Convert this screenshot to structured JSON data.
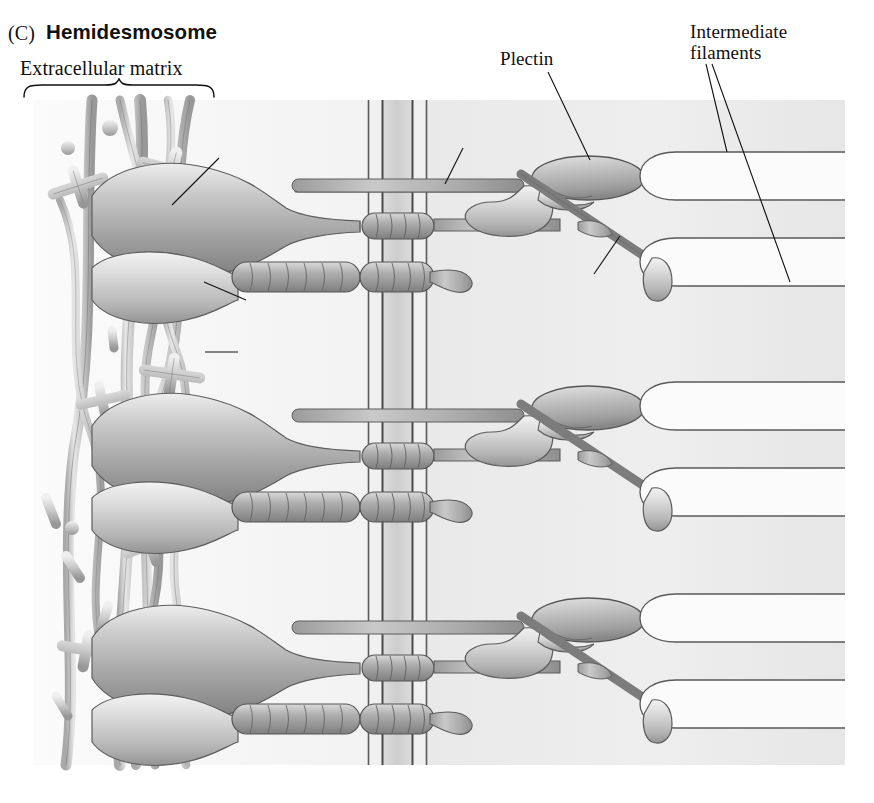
{
  "figure": {
    "panel_letter": "(C)",
    "title": "Hemidesmosome"
  },
  "labels": {
    "extracellular_matrix": "Extracellular matrix",
    "beta4_integrin_prefix": "β",
    "beta4_integrin_sub": "4",
    "beta4_integrin_suffix": " integrin",
    "alpha6_integrin_prefix": "α",
    "alpha6_integrin_sub": "6",
    "alpha6_integrin_suffix": " integrin",
    "laminin": "Laminin",
    "bp180": "BP180",
    "bp230": "BP230",
    "plectin": "Plectin",
    "intermediate_filaments_line1": "Intermediate",
    "intermediate_filaments_line2": "filaments"
  },
  "colors": {
    "ink": "#111111",
    "protein_fill_light": "#d8d8d8",
    "protein_fill_mid": "#b8b8b8",
    "protein_fill_dark": "#8e8e8e",
    "protein_outline": "#555555",
    "membrane_line": "#4a4a4a",
    "membrane_core": "#d2d2d2",
    "cytoplasm_bg": "#ebebeb",
    "ecm_bg": "#f7f7f7",
    "filament_fill": "#fbfbfb",
    "filament_outline": "#5a5a5a"
  },
  "geometry": {
    "illustration": {
      "x": 33,
      "y": 100,
      "width": 812,
      "height": 665
    },
    "membrane_x": [
      368,
      382,
      412,
      426
    ],
    "unit_y": [
      218,
      448,
      660
    ],
    "unit_count": 3
  },
  "structures": {
    "ecm_components": [
      "collagen-fiber",
      "laminin-cross",
      "proteoglycan-rod"
    ],
    "membrane_label": "plasma-membrane",
    "cytoplasmic_plaque": [
      "plectin",
      "bp180",
      "bp230"
    ],
    "filament_label": "intermediate-filament"
  }
}
